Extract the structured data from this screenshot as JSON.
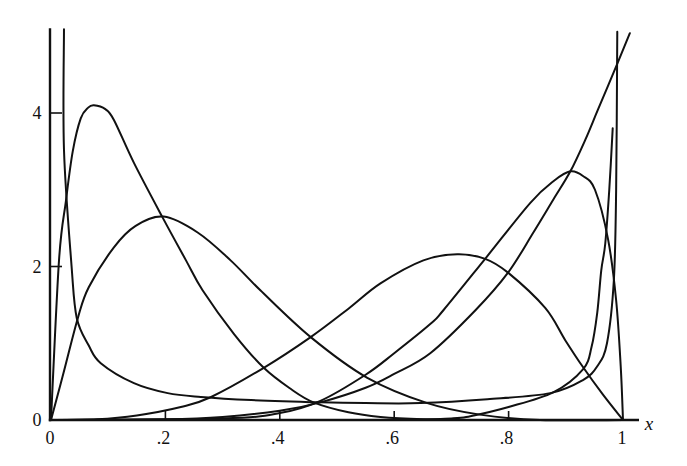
{
  "chart_data": {
    "type": "line",
    "title": "",
    "xlabel": "x",
    "ylabel": "",
    "xlim": [
      0,
      1
    ],
    "ylim": [
      0,
      5.09
    ],
    "x_axis_extent": [
      0,
      1.025
    ],
    "grid": false,
    "legend": null,
    "x_ticks": [
      0,
      0.2,
      0.4,
      0.6,
      0.8,
      1
    ],
    "x_tick_labels": [
      "0",
      ".2",
      ".4",
      ".6",
      ".8",
      "1"
    ],
    "x_tick_marks": [
      0.2,
      0.4,
      0.6,
      0.8
    ],
    "y_ticks": [
      0,
      2,
      4
    ],
    "y_tick_labels": [
      "0",
      "2",
      "4"
    ],
    "y_tick_marks": [
      2,
      4
    ],
    "series": [
      {
        "id": "A",
        "description": "right-skewed density, peak about 4.1 at x about 0.075",
        "points": [
          [
            0,
            0
          ],
          [
            0.014,
            2.08
          ],
          [
            0.026,
            2.85
          ],
          [
            0.038,
            3.5
          ],
          [
            0.052,
            3.93
          ],
          [
            0.065,
            4.07
          ],
          [
            0.075,
            4.1
          ],
          [
            0.095,
            4.05
          ],
          [
            0.11,
            3.91
          ],
          [
            0.145,
            3.35
          ],
          [
            0.195,
            2.64
          ],
          [
            0.236,
            2.08
          ],
          [
            0.265,
            1.69
          ],
          [
            0.32,
            1.12
          ],
          [
            0.372,
            0.68
          ],
          [
            0.42,
            0.4
          ],
          [
            0.459,
            0.23
          ],
          [
            0.52,
            0.1
          ],
          [
            0.576,
            0.04
          ],
          [
            0.65,
            0.01
          ],
          [
            0.75,
            0
          ],
          [
            1.0,
            0
          ]
        ]
      },
      {
        "id": "B",
        "description": "right-skewed density, peak about 2.65 at x about 0.2",
        "points": [
          [
            0,
            0
          ],
          [
            0.02,
            0.56
          ],
          [
            0.047,
            1.33
          ],
          [
            0.066,
            1.73
          ],
          [
            0.11,
            2.25
          ],
          [
            0.148,
            2.53
          ],
          [
            0.197,
            2.65
          ],
          [
            0.257,
            2.44
          ],
          [
            0.314,
            2.08
          ],
          [
            0.366,
            1.69
          ],
          [
            0.454,
            1.08
          ],
          [
            0.553,
            0.55
          ],
          [
            0.658,
            0.22
          ],
          [
            0.75,
            0.07
          ],
          [
            0.855,
            0
          ],
          [
            1.0,
            0
          ]
        ]
      },
      {
        "id": "C",
        "description": "left-skewed density, peak about 2.16 at x about 0.71",
        "points": [
          [
            0,
            0
          ],
          [
            0.08,
            0.01
          ],
          [
            0.15,
            0.06
          ],
          [
            0.227,
            0.17
          ],
          [
            0.28,
            0.3
          ],
          [
            0.372,
            0.68
          ],
          [
            0.454,
            1.08
          ],
          [
            0.52,
            1.45
          ],
          [
            0.576,
            1.78
          ],
          [
            0.651,
            2.08
          ],
          [
            0.71,
            2.16
          ],
          [
            0.759,
            2.1
          ],
          [
            0.799,
            1.92
          ],
          [
            0.864,
            1.46
          ],
          [
            0.899,
            1.04
          ],
          [
            0.93,
            0.69
          ],
          [
            0.965,
            0.33
          ],
          [
            1.0,
            0
          ]
        ]
      },
      {
        "id": "D",
        "description": "left-skewed density, peak about 3.25 at x about 0.91",
        "points": [
          [
            0,
            0
          ],
          [
            0.3,
            0.02
          ],
          [
            0.4,
            0.09
          ],
          [
            0.471,
            0.25
          ],
          [
            0.55,
            0.59
          ],
          [
            0.6,
            0.87
          ],
          [
            0.663,
            1.25
          ],
          [
            0.686,
            1.43
          ],
          [
            0.759,
            2.1
          ],
          [
            0.838,
            2.83
          ],
          [
            0.88,
            3.12
          ],
          [
            0.908,
            3.24
          ],
          [
            0.93,
            3.18
          ],
          [
            0.951,
            3.0
          ],
          [
            0.974,
            2.35
          ],
          [
            0.988,
            1.56
          ],
          [
            0.996,
            0.7
          ],
          [
            1.0,
            0
          ]
        ]
      },
      {
        "id": "E",
        "description": "monotone increasing density, about 5 at x = 1",
        "points": [
          [
            0,
            0
          ],
          [
            0.2,
            0.01
          ],
          [
            0.3,
            0.04
          ],
          [
            0.4,
            0.12
          ],
          [
            0.471,
            0.23
          ],
          [
            0.55,
            0.42
          ],
          [
            0.6,
            0.6
          ],
          [
            0.663,
            0.87
          ],
          [
            0.742,
            1.43
          ],
          [
            0.799,
            1.92
          ],
          [
            0.843,
            2.44
          ],
          [
            0.878,
            2.87
          ],
          [
            0.908,
            3.24
          ],
          [
            0.934,
            3.65
          ],
          [
            0.956,
            4.04
          ],
          [
            0.991,
            4.66
          ],
          [
            1.012,
            5.04
          ]
        ]
      },
      {
        "id": "U",
        "description": "U-shaped density, unbounded at both ends, minimum about 0.22",
        "points": [
          [
            0.0227,
            5.09
          ],
          [
            0.0227,
            3.52
          ],
          [
            0.036,
            2.0
          ],
          [
            0.045,
            1.33
          ],
          [
            0.066,
            0.97
          ],
          [
            0.087,
            0.74
          ],
          [
            0.145,
            0.48
          ],
          [
            0.204,
            0.35
          ],
          [
            0.262,
            0.3
          ],
          [
            0.35,
            0.26
          ],
          [
            0.471,
            0.23
          ],
          [
            0.55,
            0.22
          ],
          [
            0.646,
            0.22
          ],
          [
            0.763,
            0.27
          ],
          [
            0.873,
            0.35
          ],
          [
            0.93,
            0.52
          ],
          [
            0.955,
            0.7
          ],
          [
            0.972,
            1.0
          ],
          [
            0.984,
            1.82
          ],
          [
            0.988,
            3.0
          ],
          [
            0.99,
            5.06
          ]
        ]
      },
      {
        "id": "J",
        "description": "J-shaped density rising sharply near x = 1, drawn up to about 3.8",
        "points": [
          [
            0.6,
            0
          ],
          [
            0.7,
            0.02
          ],
          [
            0.733,
            0.05
          ],
          [
            0.8,
            0.17
          ],
          [
            0.878,
            0.36
          ],
          [
            0.93,
            0.66
          ],
          [
            0.945,
            0.95
          ],
          [
            0.955,
            1.4
          ],
          [
            0.962,
            1.95
          ],
          [
            0.969,
            2.3
          ],
          [
            0.976,
            3.0
          ],
          [
            0.982,
            3.8
          ]
        ]
      }
    ]
  }
}
